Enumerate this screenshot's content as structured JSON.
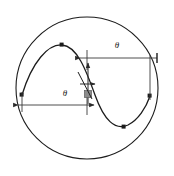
{
  "sketch": {
    "title": "sine-wave-in-circle-sketch",
    "background_color": "#ffffff",
    "geometry_color": "#1c1c1c",
    "dimension_color": "#3a3a3a",
    "highlight_color": "#8c8c8c",
    "circle": {
      "name": "boundary-circle",
      "center_x": 87,
      "center_y": 88,
      "radius": 71,
      "stroke_width": 1.1
    },
    "sine_curve": {
      "name": "sine-wave-spline",
      "stroke_width": 1.3,
      "path": "M 22,95 C 32,62 48,44 62,45 C 77,46 86,70 95,95 C 104,120 115,131 128,125 C 138,120 146,108 150,96",
      "points": [
        {
          "label": "start-point",
          "x": 22,
          "y": 95
        },
        {
          "label": "peak-point",
          "x": 62,
          "y": 45
        },
        {
          "label": "trough-point",
          "x": 124,
          "y": 127
        },
        {
          "label": "end-point",
          "x": 150,
          "y": 96
        }
      ]
    },
    "origin_marker": {
      "name": "sketch-origin",
      "x": 88,
      "y": 94,
      "size": 7,
      "color": "#8c8c8c"
    },
    "dimensions": [
      {
        "name": "upper-horizontal-dimension",
        "label": "θ",
        "label_x": 117,
        "label_y": 46,
        "line_y": 58,
        "x_start": 80,
        "x_end": 157,
        "arrow_start": "right",
        "arrow_end": "tick",
        "extension_x": 87,
        "extension_y_top": 50,
        "extension_y_bottom": 68
      },
      {
        "name": "lower-horizontal-dimension",
        "label": "θ",
        "label_x": 65,
        "label_y": 94,
        "line_y": 105,
        "x_start": 18,
        "x_end": 94,
        "arrow_start": "left",
        "arrow_end": "right",
        "extension_x": 87,
        "extension_y_top": 98,
        "extension_y_bottom": 114
      },
      {
        "name": "vertical-dimension",
        "label": "",
        "x": 88,
        "y_top": 63,
        "y_bottom": 104,
        "arrow_start": "up",
        "arrow_end": "down"
      },
      {
        "name": "short-horizontal-arrow",
        "label": "",
        "y": 84,
        "x_start": 80,
        "x_end": 95,
        "arrow_end": "right"
      }
    ],
    "extension_lines": [
      {
        "name": "left-extension-line",
        "x": 22,
        "y_top": 92,
        "y_bottom": 112
      },
      {
        "name": "right-extension-line",
        "x": 150,
        "y_top": 55,
        "y_bottom": 100
      }
    ]
  }
}
